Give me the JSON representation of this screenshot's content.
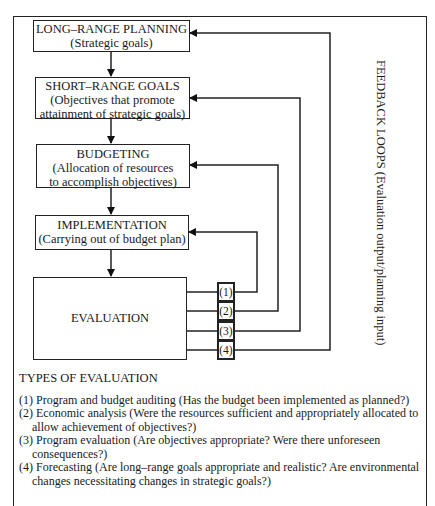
{
  "diagram": {
    "boxes": [
      {
        "title": "LONG–RANGE PLANNING",
        "subtitle": [
          "(Strategic goals)"
        ]
      },
      {
        "title": "SHORT–RANGE GOALS",
        "subtitle": [
          "(Objectives that promote",
          "attainment of strategic goals)"
        ]
      },
      {
        "title": "BUDGETING",
        "subtitle": [
          "(Allocation of resources",
          "to accomplish objectives)"
        ]
      },
      {
        "title": "IMPLEMENTATION",
        "subtitle": [
          "(Carrying out of budget plan)"
        ]
      },
      {
        "title": "EVALUATION",
        "subtitle": []
      }
    ],
    "feedback_label": "FEEDBACK LOOPS (Evaluation output/planning input)",
    "loop_numbers": [
      "(1)",
      "(2)",
      "(3)",
      "(4)"
    ]
  },
  "types": {
    "heading": "TYPES OF EVALUATION",
    "items": [
      "(1) Program and budget auditing (Has the budget been implemented as planned?)",
      "(2) Economic analysis (Were the resources sufficient and appropriately allocated to allow achievement of objectives?)",
      "(3) Program evaluation (Are objectives appropriate?  Were there unforeseen consequences?)",
      "(4) Forecasting (Are long–range goals appropriate and realistic?  Are environmental changes necessitating changes in strategic goals?)"
    ]
  }
}
